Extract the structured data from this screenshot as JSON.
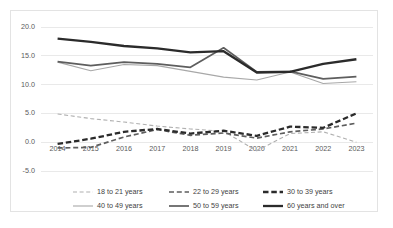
{
  "chart_data": {
    "type": "line",
    "title": "",
    "subtitle": "",
    "xlabel": "",
    "ylabel": "",
    "x": [
      "2014",
      "2015",
      "2016",
      "2017",
      "2018",
      "2019",
      "2020",
      "2021",
      "2022",
      "2023"
    ],
    "categories": [
      "2014",
      "2015",
      "2016",
      "2017",
      "2018",
      "2019",
      "2020",
      "2021",
      "2022",
      "2023"
    ],
    "ylim": [
      -5.0,
      20.0
    ],
    "ytick_labels": [
      "20.0",
      "15.0",
      "10.0",
      "5.0",
      "0.0",
      "-5.0"
    ],
    "ytick_values": [
      20.0,
      15.0,
      10.0,
      5.0,
      0.0,
      -5.0
    ],
    "grid": true,
    "grid_axis": "y",
    "legend_position": "bottom",
    "series": [
      {
        "name": "18 to 21 years",
        "values": [
          4.9,
          4.1,
          3.5,
          2.8,
          2.3,
          1.9,
          -1.5,
          1.5,
          1.8,
          0.0
        ],
        "color": "#b0b0b0",
        "width": 1.1,
        "dash": "4,2.6"
      },
      {
        "name": "22 to 29 years",
        "values": [
          -1.0,
          -0.9,
          0.9,
          2.2,
          1.2,
          1.6,
          0.7,
          1.8,
          2.3,
          3.3
        ],
        "color": "#5e5e5e",
        "width": 1.7,
        "dash": "5,2.8"
      },
      {
        "name": "30 to 39 years",
        "values": [
          -0.3,
          0.6,
          1.8,
          2.3,
          1.5,
          2.0,
          1.1,
          2.7,
          2.5,
          5.0
        ],
        "color": "#2b2b2b",
        "width": 2.3,
        "dash": "5.5,2.8"
      },
      {
        "name": "40 to 49 years",
        "values": [
          13.9,
          12.4,
          13.5,
          13.3,
          12.3,
          11.3,
          10.8,
          12.2,
          10.2,
          10.5
        ],
        "color": "#a8a8a8",
        "width": 1.1,
        "dash": "none"
      },
      {
        "name": "50 to 59 years",
        "values": [
          14.0,
          13.3,
          13.9,
          13.6,
          13.0,
          16.4,
          12.2,
          12.3,
          11.0,
          11.4
        ],
        "color": "#5e5e5e",
        "width": 1.7,
        "dash": "none"
      },
      {
        "name": "60 years and over",
        "values": [
          18.0,
          17.4,
          16.7,
          16.3,
          15.6,
          15.8,
          12.1,
          12.2,
          13.6,
          14.4
        ],
        "color": "#2b2b2b",
        "width": 2.3,
        "dash": "none"
      }
    ]
  },
  "legend": {
    "rows": [
      [
        "18 to 21 years",
        "22 to 29 years",
        "30 to 39 years"
      ],
      [
        "40 to 49 years",
        "50 to 59 years",
        "60 years and over"
      ]
    ]
  },
  "colors": {
    "background": "#ffffff",
    "border": "#e3e3e3",
    "gridline": "#e0e0e0",
    "tick_text": "#5a5a5a",
    "legend_text": "#3f3f3f"
  }
}
